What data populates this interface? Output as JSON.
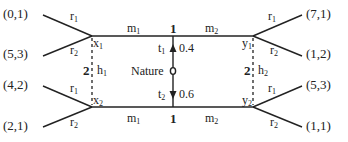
{
  "diagram": {
    "type": "extensive-form game tree",
    "nature": {
      "label": "Nature",
      "moves": [
        {
          "label": "t",
          "sub": "1",
          "prob": "0.4"
        },
        {
          "label": "t",
          "sub": "2",
          "prob": "0.6"
        }
      ]
    },
    "player1_nodes": [
      {
        "label": "x",
        "sub": "1"
      },
      {
        "label": "x",
        "sub": "2"
      }
    ],
    "player2_nodes": [
      {
        "label": "y",
        "sub": "1"
      },
      {
        "label": "y",
        "sub": "2"
      }
    ],
    "info_sets": [
      {
        "label": "h",
        "sub": "1",
        "player": "2"
      },
      {
        "label": "h",
        "sub": "2",
        "player": "2"
      }
    ],
    "top_edge": {
      "player": "1",
      "left_action": {
        "label": "m",
        "sub": "1"
      },
      "right_action": {
        "label": "m",
        "sub": "2"
      }
    },
    "bottom_edge": {
      "player": "1",
      "left_action": {
        "label": "m",
        "sub": "1"
      },
      "right_action": {
        "label": "m",
        "sub": "2"
      }
    },
    "left_actions": [
      {
        "label": "r",
        "sub": "1"
      },
      {
        "label": "r",
        "sub": "2"
      },
      {
        "label": "r",
        "sub": "1"
      },
      {
        "label": "r",
        "sub": "2"
      }
    ],
    "right_actions": [
      {
        "label": "r",
        "sub": "1"
      },
      {
        "label": "r",
        "sub": "2"
      },
      {
        "label": "r",
        "sub": "1"
      },
      {
        "label": "r",
        "sub": "2"
      }
    ],
    "payoffs_left": [
      "(0,1)",
      "(5,3)",
      "(4,2)",
      "(2,1)"
    ],
    "payoffs_right": [
      "(7,1)",
      "(1,2)",
      "(5,3)",
      "(1,1)"
    ]
  }
}
